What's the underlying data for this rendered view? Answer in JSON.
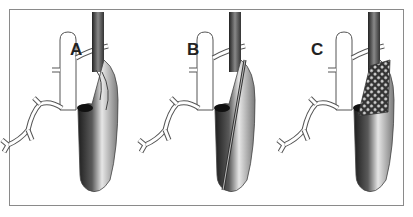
{
  "figure": {
    "panels": [
      {
        "label": "A",
        "stage": "vessel-with-dissection"
      },
      {
        "label": "B",
        "stage": "catheter-insertion"
      },
      {
        "label": "C",
        "stage": "stent-deployed"
      }
    ]
  },
  "colors": {
    "frame": "#8a8a8a",
    "vessel_dark": "#2a2a2a",
    "vessel_light": "#d8d8d8",
    "branch": "#ffffff",
    "outline": "#555555"
  }
}
